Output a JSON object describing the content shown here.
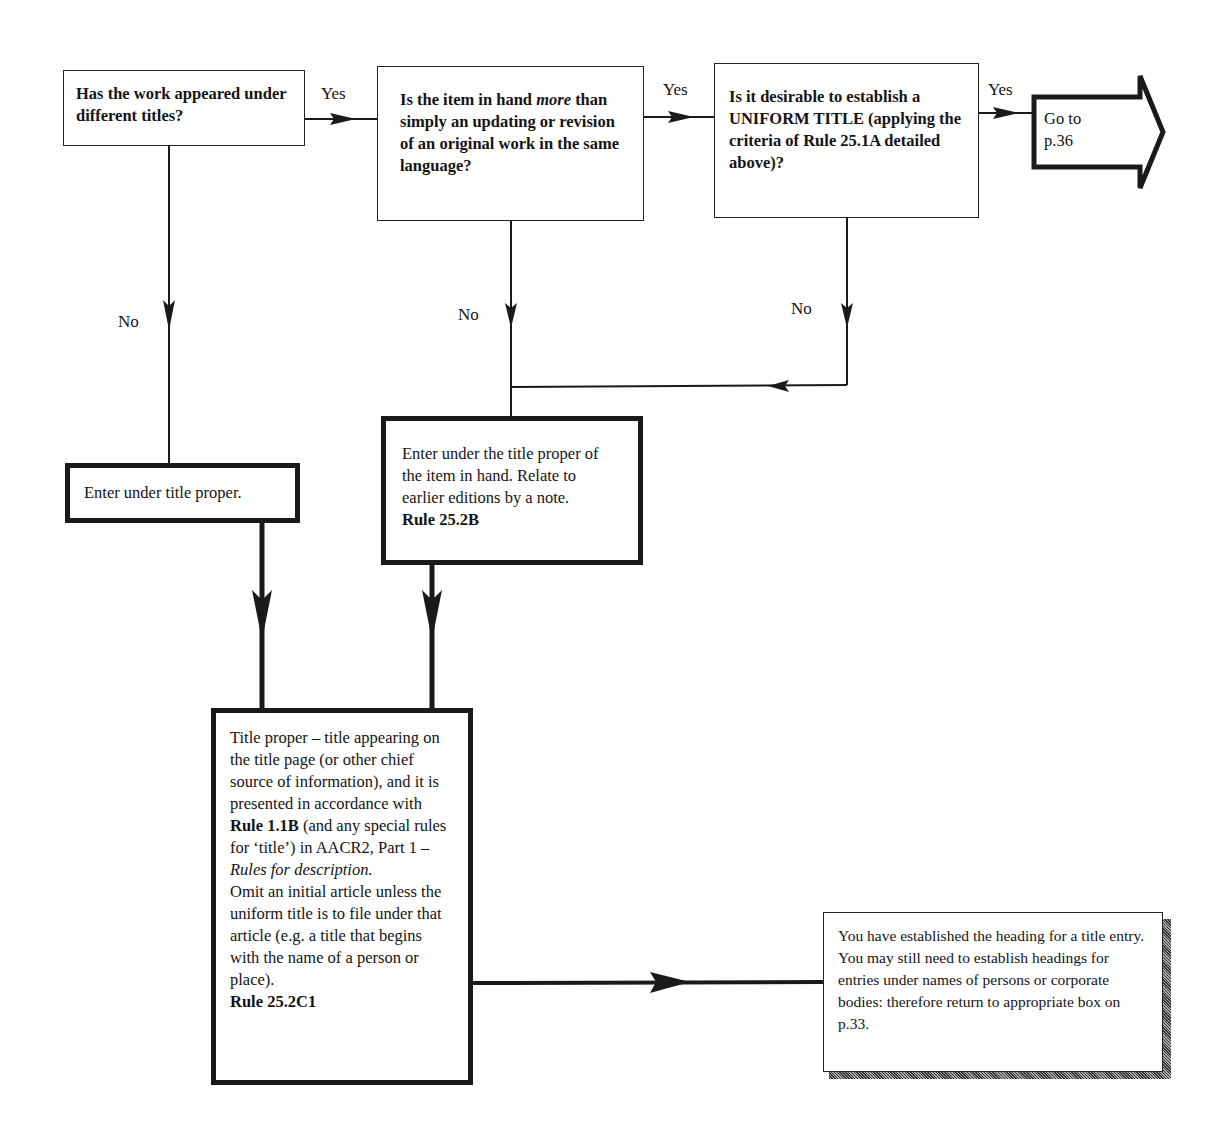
{
  "nodes": {
    "q1": {
      "text": "Has the work appeared under different titles?"
    },
    "q2": {
      "text_a": "Is the item in hand ",
      "text_em": "more",
      "text_b": " than simply an updating or revision of an original work in the same language?"
    },
    "q3": {
      "text": "Is it desirable to establish a UNIFORM TITLE (applying the criteria of Rule 25.1A detailed above)?"
    },
    "goto": {
      "text_line1": "Go to",
      "text_line2": "p.36"
    },
    "enter_title_proper": {
      "text": "Enter under title proper."
    },
    "enter_item_in_hand": {
      "text": "Enter under the title proper of the item in hand. Relate to earlier editions by a note.",
      "rule": "Rule 25.2B"
    },
    "title_proper_def": {
      "p1": "Title proper – title appearing on the title page (or other chief source of information), and it is presented in accordance with ",
      "rule1": "Rule 1.1B",
      "p2": " (and any special rules for ‘title’) in AACR2, Part 1 – ",
      "em": "Rules for description.",
      "p3": "Omit an initial article unless the uniform title is to file under that article (e.g. a title that begins with the name of a person or place).",
      "rule2": "Rule 25.2C1"
    },
    "final": {
      "text": "You have established the heading for a title entry. You may still need to establish headings for entries under names of persons or corporate bodies: therefore return to appropriate box on p.33."
    }
  },
  "edge_labels": {
    "q1_yes": "Yes",
    "q2_yes": "Yes",
    "q3_yes": "Yes",
    "q1_no": "No",
    "q2_no": "No",
    "q3_no": "No"
  }
}
